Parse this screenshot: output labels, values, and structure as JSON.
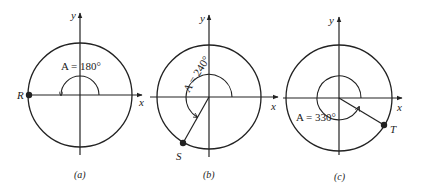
{
  "figures": [
    {
      "id": "a",
      "caption": "(a)",
      "angle_label": "A = 180°",
      "angle_deg": 180,
      "point_label": "R",
      "axis_x_label": "x",
      "axis_y_label": "y"
    },
    {
      "id": "b",
      "caption": "(b)",
      "angle_label": "A = 240°",
      "angle_deg": 240,
      "point_label": "S",
      "axis_x_label": "x",
      "axis_y_label": "y"
    },
    {
      "id": "c",
      "caption": "(c)",
      "angle_label": "A = 330°",
      "angle_deg": 330,
      "point_label": "T",
      "axis_x_label": "x",
      "axis_y_label": "y"
    }
  ],
  "colors": {
    "ink": "#222222",
    "background": "#ffffff"
  }
}
